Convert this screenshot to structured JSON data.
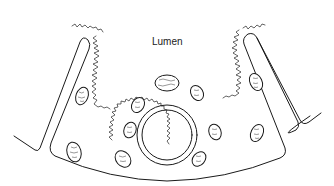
{
  "figure": {
    "type": "histology-line-drawing",
    "colors": {
      "ink": "#1a1a1a",
      "background": "#ffffff"
    },
    "labels": [
      {
        "id": "lumen",
        "text": "Lumen",
        "x": 152,
        "y": 45
      }
    ],
    "structures": {
      "basement_membrane": "outer curved boundary of epithelial fold",
      "left_duct": "left parallel-walled duct with bent foot",
      "right_duct": "right parallel-walled duct with bent foot",
      "central_vessel": {
        "cx": 167,
        "cy": 135,
        "r_outer": 30,
        "r_inner": 25
      },
      "brush_border": "wavy microvilli lining lumen surface",
      "nuclei": [
        {
          "cx": 82,
          "cy": 96,
          "rx": 6,
          "ry": 9,
          "rot": 20
        },
        {
          "cx": 74,
          "cy": 152,
          "rx": 7,
          "ry": 10,
          "rot": -15
        },
        {
          "cx": 138,
          "cy": 105,
          "rx": 6,
          "ry": 8,
          "rot": 30
        },
        {
          "cx": 130,
          "cy": 130,
          "rx": 6,
          "ry": 8,
          "rot": 20
        },
        {
          "cx": 123,
          "cy": 159,
          "rx": 7,
          "ry": 9,
          "rot": -40
        },
        {
          "cx": 167,
          "cy": 83,
          "rx": 12,
          "ry": 8,
          "rot": 0
        },
        {
          "cx": 197,
          "cy": 93,
          "rx": 6,
          "ry": 8,
          "rot": -30
        },
        {
          "cx": 215,
          "cy": 132,
          "rx": 6,
          "ry": 8,
          "rot": -20
        },
        {
          "cx": 199,
          "cy": 159,
          "rx": 6,
          "ry": 8,
          "rot": 40
        },
        {
          "cx": 256,
          "cy": 82,
          "rx": 6,
          "ry": 9,
          "rot": -25
        },
        {
          "cx": 257,
          "cy": 133,
          "rx": 6,
          "ry": 9,
          "rot": 25
        }
      ]
    }
  }
}
